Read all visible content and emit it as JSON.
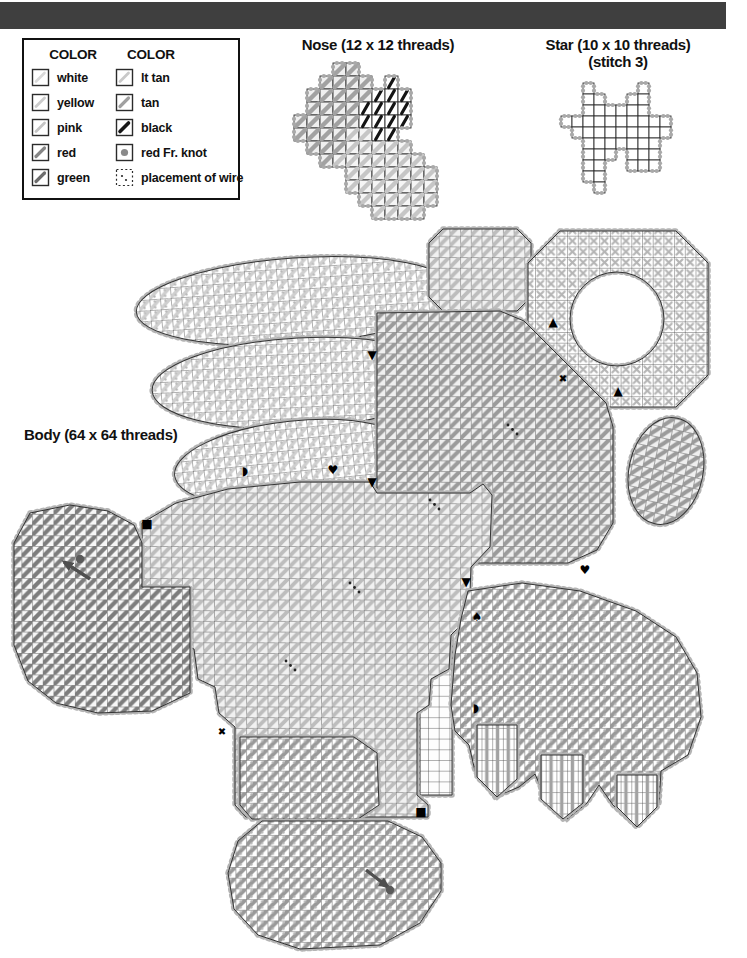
{
  "page": {
    "background": "#ffffff",
    "top_bar_color": "#3f3f3f"
  },
  "legend": {
    "columns": [
      {
        "header": "COLOR",
        "items": [
          {
            "label": "white",
            "swatch": "stitch",
            "color": "#d9d9d9",
            "stroke_width": 2.6
          },
          {
            "label": "yellow",
            "swatch": "stitch",
            "color": "#cccccc",
            "stroke_width": 2.8
          },
          {
            "label": "pink",
            "swatch": "stitch",
            "color": "#c4c4c4",
            "stroke_width": 2.8
          },
          {
            "label": "red",
            "swatch": "stitch",
            "color": "#868686",
            "stroke_width": 3.2
          },
          {
            "label": "green",
            "swatch": "stitch",
            "color": "#6e6e6e",
            "stroke_width": 3.2
          }
        ]
      },
      {
        "header": "COLOR",
        "items": [
          {
            "label": "lt tan",
            "swatch": "stitch",
            "color": "#c9c9c9",
            "stroke_width": 2.8
          },
          {
            "label": "tan",
            "swatch": "stitch",
            "color": "#a0a0a0",
            "stroke_width": 3.2
          },
          {
            "label": "black",
            "swatch": "stitch",
            "color": "#161616",
            "stroke_width": 3.6
          },
          {
            "label": "red Fr. knot",
            "swatch": "knot",
            "color": "#8a8a8a"
          },
          {
            "label": "placement of wire",
            "swatch": "wire",
            "color": "#2a2a2a"
          }
        ]
      }
    ]
  },
  "charts": {
    "nose": {
      "title": "Nose (12 x 12 threads)",
      "threads": "12 x 12",
      "cell": 13,
      "grid": [
        "...gg.......",
        "..gggg.b....",
        ".gggggbbb...",
        ".ggggbbbb...",
        "gggggbbbb...",
        "ggggllbb....",
        ".ggglllll...",
        "..glllllll..",
        "....lllllll.",
        "....lllllll.",
        ".....llllll.",
        "......llll.."
      ],
      "styles": {
        "g": {
          "bg": "#efefef",
          "diag": "#a2a2a2",
          "w": 4.4
        },
        "l": {
          "bg": "#f5f5f5",
          "diag": "#c6c6c6",
          "w": 4.4
        },
        "b": {
          "bg": "#ffffff",
          "diag": "#141414",
          "w": 3.2,
          "steep": true
        }
      }
    },
    "star": {
      "title_line1": "Star (10 x 10 threads)",
      "title_line2": "(stitch 3)",
      "threads": "10 x 10",
      "cell": 11,
      "grid": [
        "..g....g..",
        "..gg..gg..",
        "..gggggg..",
        "gggggggggg",
        ".ggggggggg",
        "..ggggggg.",
        "..ggg.ggg.",
        "..gg..ggg.",
        "..gg......",
        "...g......"
      ],
      "styles": {
        "g": {
          "bg": "#ffffff"
        }
      }
    },
    "body": {
      "title": "Body (64 x 64 threads)",
      "threads": "64 x 64",
      "patterns": {
        "wh": {
          "bg": "#ffffff",
          "diag": "#cfcfcf",
          "w": 3.4,
          "dots": true
        },
        "lt": {
          "bg": "#f1f1f1",
          "diag": "#bdbdbd",
          "w": 3.8
        },
        "md": {
          "bg": "#efefef",
          "diag": "#9b9b9b",
          "w": 4.0
        },
        "fan": {
          "bg": "#ffffff",
          "diag": "#999999",
          "w": 4.0,
          "dots": true
        },
        "dk": {
          "bg": "#f7f7f7",
          "diag": "#7d7d7d",
          "w": 4.2
        },
        "cross": {
          "bg": "#ffffff",
          "cross": "#b5b5b5"
        },
        "vert": {
          "bg": "#ffffff",
          "vert": "#a2a2a2"
        },
        "bare": {
          "bg": "#fdfdfd"
        }
      },
      "pieces": [
        {
          "id": "open-canvas-row",
          "type": "poly",
          "fill": "bare",
          "points": [
            [
              245,
              244
            ],
            [
              372,
              244
            ],
            [
              372,
              259
            ],
            [
              245,
              259
            ]
          ]
        },
        {
          "id": "open-canvas-col",
          "type": "poly",
          "fill": "bare",
          "points": [
            [
              362,
              90
            ],
            [
              376,
              90
            ],
            [
              376,
              244
            ],
            [
              362,
              244
            ]
          ]
        },
        {
          "id": "open-canvas-col-2",
          "type": "poly",
          "fill": "bare",
          "points": [
            [
              420,
              356
            ],
            [
              452,
              356
            ],
            [
              452,
              570
            ],
            [
              420,
              570
            ]
          ]
        },
        {
          "id": "left-wing-feather-1",
          "type": "ellipse",
          "fill": "wh",
          "cx": 296,
          "cy": 76,
          "rx": 160,
          "ry": 43,
          "rot": -4
        },
        {
          "id": "left-wing-feather-2",
          "type": "ellipse",
          "fill": "wh",
          "cx": 300,
          "cy": 158,
          "rx": 148,
          "ry": 45,
          "rot": -3
        },
        {
          "id": "left-wing-feather-3",
          "type": "ellipse",
          "fill": "wh",
          "cx": 294,
          "cy": 238,
          "rx": 120,
          "ry": 42,
          "rot": -6
        },
        {
          "id": "top-ear",
          "type": "poly",
          "fill": "lt",
          "points": [
            [
              443,
              4
            ],
            [
              517,
              4
            ],
            [
              531,
              18
            ],
            [
              531,
              72
            ],
            [
              517,
              86
            ],
            [
              443,
              86
            ],
            [
              429,
              72
            ],
            [
              429,
              18
            ]
          ]
        },
        {
          "id": "halo-ring",
          "type": "ring",
          "fill": "cross",
          "outer": [
            [
              560,
              6
            ],
            [
              676,
              6
            ],
            [
              708,
              38
            ],
            [
              708,
              150
            ],
            [
              676,
              182
            ],
            [
              560,
              182
            ],
            [
              528,
              150
            ],
            [
              528,
              38
            ]
          ],
          "hole": {
            "cx": 617,
            "cy": 94,
            "r": 47
          }
        },
        {
          "id": "head",
          "type": "poly",
          "fill": "md",
          "points": [
            [
              377,
              88
            ],
            [
              500,
              86
            ],
            [
              524,
              96
            ],
            [
              606,
              178
            ],
            [
              613,
              202
            ],
            [
              613,
              298
            ],
            [
              597,
              325
            ],
            [
              568,
              338
            ],
            [
              420,
              338
            ],
            [
              392,
              332
            ],
            [
              377,
              318
            ]
          ]
        },
        {
          "id": "right-paw",
          "type": "ellipse",
          "fill": "md",
          "cx": 666,
          "cy": 246,
          "rx": 37,
          "ry": 54,
          "rot": 12
        },
        {
          "id": "body-main",
          "type": "poly",
          "fill": "lt",
          "points": [
            [
              142,
              298
            ],
            [
              176,
              278
            ],
            [
              228,
              264
            ],
            [
              300,
              257
            ],
            [
              370,
              257
            ],
            [
              377,
              268
            ],
            [
              470,
              268
            ],
            [
              483,
              259
            ],
            [
              492,
              270
            ],
            [
              490,
              322
            ],
            [
              471,
              342
            ],
            [
              469,
              392
            ],
            [
              451,
              410
            ],
            [
              449,
              444
            ],
            [
              431,
              454
            ],
            [
              429,
              480
            ],
            [
              417,
              488
            ],
            [
              417,
              570
            ],
            [
              428,
              580
            ],
            [
              428,
              592
            ],
            [
              246,
              592
            ],
            [
              235,
              580
            ],
            [
              235,
              502
            ],
            [
              219,
              488
            ],
            [
              215,
              462
            ],
            [
              198,
              454
            ],
            [
              194,
              424
            ],
            [
              158,
              412
            ],
            [
              143,
              396
            ]
          ]
        },
        {
          "id": "left-arm",
          "type": "poly",
          "fill": "dk",
          "points": [
            [
              30,
              288
            ],
            [
              70,
              280
            ],
            [
              108,
              286
            ],
            [
              134,
              300
            ],
            [
              142,
              318
            ],
            [
              142,
              362
            ],
            [
              190,
              362
            ],
            [
              190,
              468
            ],
            [
              152,
              486
            ],
            [
              98,
              488
            ],
            [
              56,
              478
            ],
            [
              28,
              456
            ],
            [
              14,
              420
            ],
            [
              14,
              318
            ]
          ]
        },
        {
          "id": "right-wing-fan",
          "type": "poly",
          "fill": "fan",
          "points": [
            [
              468,
              366
            ],
            [
              522,
              358
            ],
            [
              580,
              366
            ],
            [
              636,
              386
            ],
            [
              676,
              412
            ],
            [
              697,
              448
            ],
            [
              701,
              492
            ],
            [
              688,
              530
            ],
            [
              661,
              546
            ],
            [
              659,
              578
            ],
            [
              637,
              602
            ],
            [
              613,
              580
            ],
            [
              599,
              560
            ],
            [
              587,
              578
            ],
            [
              567,
              594
            ],
            [
              545,
              572
            ],
            [
              535,
              549
            ],
            [
              519,
              562
            ],
            [
              495,
              572
            ],
            [
              475,
              546
            ],
            [
              469,
              520
            ],
            [
              455,
              506
            ],
            [
              451,
              480
            ],
            [
              455,
              430
            ],
            [
              461,
              394
            ]
          ]
        },
        {
          "id": "feather-tip-1",
          "type": "poly",
          "fill": "vert",
          "points": [
            [
              477,
              500
            ],
            [
              517,
              500
            ],
            [
              517,
              554
            ],
            [
              497,
              572
            ],
            [
              477,
              552
            ]
          ]
        },
        {
          "id": "feather-tip-2",
          "type": "poly",
          "fill": "vert",
          "points": [
            [
              541,
              530
            ],
            [
              583,
              530
            ],
            [
              583,
              578
            ],
            [
              563,
              594
            ],
            [
              541,
              574
            ]
          ]
        },
        {
          "id": "feather-tip-3",
          "type": "poly",
          "fill": "vert",
          "points": [
            [
              617,
              550
            ],
            [
              657,
              550
            ],
            [
              657,
              582
            ],
            [
              637,
              602
            ],
            [
              617,
              582
            ]
          ]
        },
        {
          "id": "left-foot",
          "type": "poly",
          "fill": "fan",
          "points": [
            [
              240,
              512
            ],
            [
              354,
              512
            ],
            [
              377,
              528
            ],
            [
              379,
              580
            ],
            [
              358,
              594
            ],
            [
              252,
              594
            ],
            [
              240,
              580
            ]
          ]
        },
        {
          "id": "foot-pad",
          "type": "poly",
          "fill": "fan",
          "points": [
            [
              262,
              596
            ],
            [
              388,
              596
            ],
            [
              422,
              612
            ],
            [
              441,
              638
            ],
            [
              441,
              666
            ],
            [
              420,
              698
            ],
            [
              380,
              720
            ],
            [
              300,
              724
            ],
            [
              258,
              710
            ],
            [
              234,
              684
            ],
            [
              228,
              648
            ],
            [
              238,
              616
            ]
          ]
        }
      ],
      "symbols": [
        {
          "glyph": "■",
          "name": "square",
          "x": 147,
          "y": 299,
          "size": 12
        },
        {
          "glyph": "■",
          "name": "square",
          "x": 421,
          "y": 587,
          "size": 12
        },
        {
          "glyph": "▲",
          "name": "triangle-up",
          "x": 553,
          "y": 97,
          "size": 12
        },
        {
          "glyph": "▲",
          "name": "triangle-up",
          "x": 618,
          "y": 166,
          "size": 12
        },
        {
          "glyph": "▼",
          "name": "triangle-down",
          "x": 372,
          "y": 130,
          "size": 12
        },
        {
          "glyph": "▼",
          "name": "triangle-down",
          "x": 372,
          "y": 257,
          "size": 12
        },
        {
          "glyph": "▼",
          "name": "triangle-down",
          "x": 466,
          "y": 357,
          "size": 12
        },
        {
          "glyph": "♥",
          "name": "heart",
          "x": 333,
          "y": 245,
          "size": 12
        },
        {
          "glyph": "♥",
          "name": "heart",
          "x": 585,
          "y": 345,
          "size": 12
        },
        {
          "glyph": "◗",
          "name": "half-circle",
          "x": 245,
          "y": 246,
          "size": 12
        },
        {
          "glyph": "◗",
          "name": "half-circle",
          "x": 476,
          "y": 483,
          "size": 12
        },
        {
          "glyph": "♠",
          "name": "spade",
          "x": 477,
          "y": 392,
          "size": 12
        },
        {
          "glyph": "✖",
          "name": "x-mark",
          "x": 563,
          "y": 153,
          "size": 10
        },
        {
          "glyph": "✖",
          "name": "x-mark",
          "x": 222,
          "y": 506,
          "size": 10
        }
      ],
      "wire_marks": [
        [
          508,
          200
        ],
        [
          430,
          275
        ],
        [
          350,
          358
        ],
        [
          286,
          436
        ]
      ],
      "arrows": [
        {
          "x1": 90,
          "y1": 354,
          "x2": 64,
          "y2": 337,
          "dot": [
            80,
            334
          ]
        },
        {
          "x1": 366,
          "y1": 645,
          "x2": 388,
          "y2": 662,
          "dot": [
            390,
            665
          ]
        }
      ]
    }
  }
}
